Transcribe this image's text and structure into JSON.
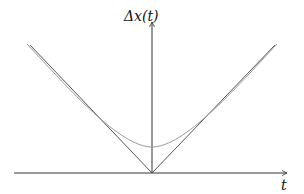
{
  "diagram": {
    "y_axis_label": "Δx(t)",
    "x_axis_label": "t",
    "colors": {
      "axis": "#333333",
      "asymptote": "#555555",
      "curve": "#9a9a9a"
    },
    "elements": [
      {
        "name": "light-cone-left",
        "description": "straight line from origin going up-left"
      },
      {
        "name": "light-cone-right",
        "description": "straight line from origin going up-right"
      },
      {
        "name": "hyperbola-curve",
        "description": "smooth curve with minimum above origin, approaching the straight lines asymptotically"
      }
    ]
  }
}
